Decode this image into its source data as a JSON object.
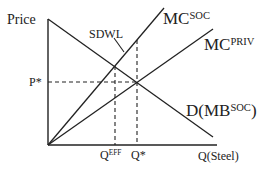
{
  "diagram": {
    "type": "economics-externality-supply-demand",
    "axes": {
      "y_label": "Price",
      "x_label": "Q(Steel)"
    },
    "curves": [
      {
        "id": "mc_soc",
        "base": "MC",
        "sup": "SOC"
      },
      {
        "id": "mc_priv",
        "base": "MC",
        "sup": "PRIV"
      },
      {
        "id": "demand",
        "base": "D(MB",
        "sup": "SOC",
        "suffix": ")"
      }
    ],
    "annotations": {
      "deadweight_loss": "SDWL",
      "price_star": "P*",
      "q_eff_base": "Q",
      "q_eff_sup": "EFF",
      "q_star": "Q*"
    },
    "colors": {
      "line": "#222222",
      "background": "#ffffff"
    }
  }
}
